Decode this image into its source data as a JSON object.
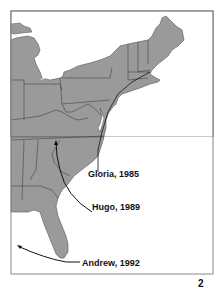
{
  "map": {
    "region": "Eastern United States",
    "panel_number": "2",
    "land_color": "#9a9a9a",
    "border_color": "#333333",
    "water_color": "#ffffff",
    "frame_color": "#888888",
    "hurricanes": [
      {
        "name": "Gloria",
        "year": "1985",
        "label": "Gloria, 1985"
      },
      {
        "name": "Hugo",
        "year": "1989",
        "label": "Hugo, 1989"
      },
      {
        "name": "Andrew",
        "year": "1992",
        "label": "Andrew, 1992"
      }
    ]
  }
}
